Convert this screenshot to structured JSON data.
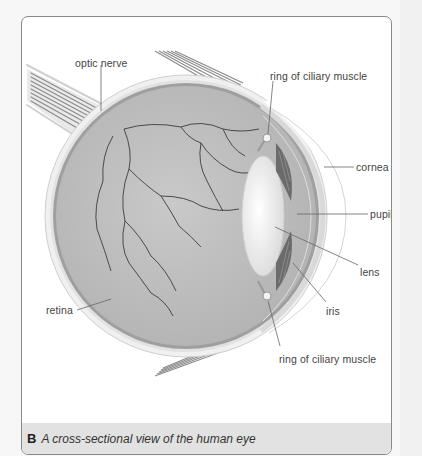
{
  "figure": {
    "labels": {
      "optic_nerve": "optic nerve",
      "ring_top": "ring of ciliary muscle",
      "cornea": "cornea",
      "pupil": "pupil",
      "lens": "lens",
      "iris": "iris",
      "retina": "retina",
      "ring_bottom": "ring of ciliary muscle"
    },
    "colors": {
      "eyeball_fill": "#bdbdbd",
      "sclera": "#e3e3e3",
      "retina_band": "#9a9a9a",
      "vessels": "#3a3a3a",
      "lens": "#f6f6f6",
      "iris": "#6a6a6a",
      "leader_lines": "#666666"
    }
  },
  "caption": {
    "letter": "B",
    "text": "A cross-sectional view of the human eye"
  }
}
